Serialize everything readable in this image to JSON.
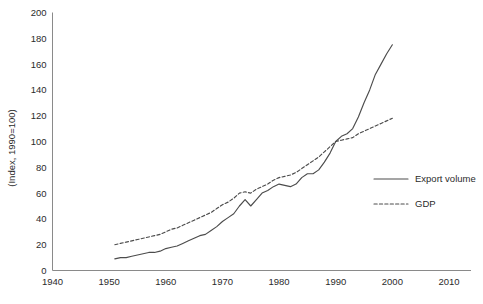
{
  "chart_data": {
    "type": "line",
    "title": "",
    "subtitle": "",
    "xlabel": "",
    "ylabel": "(Index, 1990=100)",
    "xlim": [
      1940,
      2010
    ],
    "ylim": [
      0,
      200
    ],
    "xticks": [
      1940,
      1950,
      1960,
      1970,
      1980,
      1990,
      2000,
      2010
    ],
    "yticks": [
      0,
      20,
      40,
      60,
      80,
      100,
      120,
      140,
      160,
      180,
      200
    ],
    "xtick_labels": [
      "1940",
      "1950",
      "1960",
      "1970",
      "1980",
      "1990",
      "2000",
      "2010"
    ],
    "ytick_labels": [
      "0",
      "20",
      "40",
      "60",
      "80",
      "100",
      "120",
      "140",
      "160",
      "180",
      "200"
    ],
    "grid": false,
    "legend_position": "right-middle",
    "x": [
      1951,
      1952,
      1953,
      1954,
      1955,
      1956,
      1957,
      1958,
      1959,
      1960,
      1961,
      1962,
      1963,
      1964,
      1965,
      1966,
      1967,
      1968,
      1969,
      1970,
      1971,
      1972,
      1973,
      1974,
      1975,
      1976,
      1977,
      1978,
      1979,
      1980,
      1981,
      1982,
      1983,
      1984,
      1985,
      1986,
      1987,
      1988,
      1989,
      1990,
      1991,
      1992,
      1993,
      1994,
      1995,
      1996,
      1997,
      1998,
      1999,
      2000
    ],
    "series": [
      {
        "name": "Export volume",
        "style": "solid",
        "color": "#4c4c4c",
        "values": [
          9,
          10,
          10,
          11,
          12,
          13,
          14,
          14,
          15,
          17,
          18,
          19,
          21,
          23,
          25,
          27,
          28,
          31,
          34,
          38,
          41,
          44,
          50,
          55,
          50,
          55,
          60,
          62,
          65,
          67,
          66,
          65,
          67,
          72,
          75,
          75,
          78,
          84,
          91,
          100,
          104,
          106,
          110,
          119,
          130,
          140,
          152,
          160,
          168,
          175
        ]
      },
      {
        "name": "GDP",
        "style": "dashed",
        "color": "#4c4c4c",
        "values": [
          20,
          21,
          22,
          23,
          24,
          25,
          26,
          27,
          28,
          30,
          32,
          33,
          35,
          37,
          39,
          41,
          43,
          45,
          48,
          51,
          53,
          56,
          60,
          61,
          60,
          63,
          65,
          67,
          70,
          72,
          73,
          74,
          76,
          79,
          82,
          85,
          88,
          92,
          96,
          100,
          101,
          102,
          103,
          106,
          108,
          110,
          112,
          114,
          116,
          118
        ]
      }
    ],
    "legend_entries": [
      {
        "label": "Export volume",
        "style": "solid"
      },
      {
        "label": "GDP",
        "style": "dashed"
      }
    ],
    "annotations": []
  },
  "axes": {
    "y_axis_title": "(Index, 1990=100)"
  }
}
